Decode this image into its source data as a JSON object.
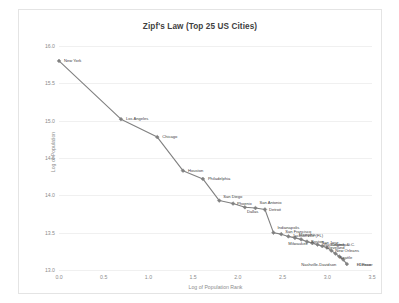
{
  "chart_data": {
    "type": "line",
    "title": "Zipf's Law (Top 25 US Cities)",
    "xlabel": "Log of Population Rank",
    "ylabel": "Log of Population",
    "xlim": [
      0.0,
      3.5
    ],
    "ylim": [
      13.0,
      16.0
    ],
    "xticks": [
      "0.0",
      "0.5",
      "1.0",
      "1.5",
      "2.0",
      "2.5",
      "3.0",
      "3.5"
    ],
    "yticks": [
      "13.0",
      "13.5",
      "14.0",
      "14.5",
      "15.0",
      "15.5",
      "16.0"
    ],
    "grid": true,
    "legend": "none",
    "marker": "diamond",
    "line_color": "#808080",
    "marker_color": "#808080",
    "text_color": "#404040",
    "axis_color": "#8c8c8c",
    "grid_color": "#f0f0f0",
    "series_name": "Top 25 US Cities",
    "points": [
      {
        "label": "New York",
        "rank": 1,
        "x": 0.0,
        "y": 15.8,
        "lx": 5,
        "ly": 0
      },
      {
        "label": "Los Angeles",
        "rank": 2,
        "x": 0.693,
        "y": 15.02,
        "lx": 5,
        "ly": 0
      },
      {
        "label": "Chicago",
        "rank": 3,
        "x": 1.099,
        "y": 14.78,
        "lx": 5,
        "ly": 0
      },
      {
        "label": "Houston",
        "rank": 4,
        "x": 1.386,
        "y": 14.33,
        "lx": 5,
        "ly": 0
      },
      {
        "label": "Philadelphia",
        "rank": 5,
        "x": 1.609,
        "y": 14.22,
        "lx": 5,
        "ly": 0
      },
      {
        "label": "San Diego",
        "rank": 6,
        "x": 1.792,
        "y": 13.93,
        "lx": 4,
        "ly": -4
      },
      {
        "label": "Phoenix",
        "rank": 7,
        "x": 1.946,
        "y": 13.89,
        "lx": 4,
        "ly": 0
      },
      {
        "label": "Dallas",
        "rank": 8,
        "x": 2.079,
        "y": 13.84,
        "lx": 2,
        "ly": 5
      },
      {
        "label": "San Antonio",
        "rank": 9,
        "x": 2.197,
        "y": 13.83,
        "lx": 4,
        "ly": -5
      },
      {
        "label": "Detroit",
        "rank": 10,
        "x": 2.303,
        "y": 13.81,
        "lx": 4,
        "ly": 0
      },
      {
        "label": "Indianapolis",
        "rank": 11,
        "x": 2.398,
        "y": 13.5,
        "lx": 4,
        "ly": -5
      },
      {
        "label": "San Francisco",
        "rank": 12,
        "x": 2.485,
        "y": 13.48,
        "lx": 4,
        "ly": -2
      },
      {
        "label": "Jacksonville (FL)",
        "rank": 13,
        "x": 2.565,
        "y": 13.45,
        "lx": 4,
        "ly": 0
      },
      {
        "label": "Memphis",
        "rank": 14,
        "x": 2.639,
        "y": 13.43,
        "lx": 4,
        "ly": -3
      },
      {
        "label": "Washington, D.C.",
        "rank": 15,
        "x": 2.708,
        "y": 13.41,
        "lx": 22,
        "ly": 6
      },
      {
        "label": "Boston",
        "rank": 16,
        "x": 2.773,
        "y": 13.38,
        "lx": 4,
        "ly": 0
      },
      {
        "label": "Milwaukee",
        "rank": 17,
        "x": 2.833,
        "y": 13.36,
        "lx": -24,
        "ly": 1
      },
      {
        "label": "San Jose",
        "rank": 18,
        "x": 2.89,
        "y": 13.34,
        "lx": 4,
        "ly": -2
      },
      {
        "label": "Cleveland",
        "rank": 19,
        "x": 2.944,
        "y": 13.32,
        "lx": 4,
        "ly": 2
      },
      {
        "label": "Columbus",
        "rank": 20,
        "x": 2.996,
        "y": 13.3,
        "lx": 4,
        "ly": -3
      },
      {
        "label": "New Orleans",
        "rank": 21,
        "x": 3.045,
        "y": 13.26,
        "lx": 4,
        "ly": 0
      },
      {
        "label": "Seattle",
        "rank": 22,
        "x": 3.091,
        "y": 13.22,
        "lx": 4,
        "ly": 4
      },
      {
        "label": "Denver",
        "rank": 23,
        "x": 3.135,
        "y": 13.18,
        "lx": 20,
        "ly": 8
      },
      {
        "label": "Nashville-Davidson",
        "rank": 24,
        "x": 3.178,
        "y": 13.14,
        "lx": -42,
        "ly": 5
      },
      {
        "label": "El Paso",
        "rank": 25,
        "x": 3.219,
        "y": 13.08,
        "lx": 10,
        "ly": 1
      }
    ]
  }
}
